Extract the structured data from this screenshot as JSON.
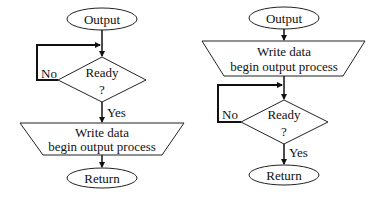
{
  "diagram": {
    "type": "flowchart",
    "left": {
      "start": "Output",
      "decision_line1": "Ready",
      "decision_line2": "?",
      "no_label": "No",
      "yes_label": "Yes",
      "process_line1": "Write data",
      "process_line2": "begin output process",
      "end": "Return"
    },
    "right": {
      "start": "Output",
      "process_line1": "Write data",
      "process_line2": "begin output process",
      "decision_line1": "Ready",
      "decision_line2": "?",
      "no_label": "No",
      "yes_label": "Yes",
      "end": "Return"
    }
  }
}
